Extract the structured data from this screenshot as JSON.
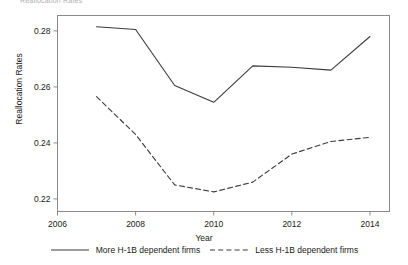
{
  "clipped_header_text": "Reallocation Rates",
  "chart_data": {
    "type": "line",
    "title": "",
    "xlabel": "Year",
    "ylabel": "Reallocation Rates",
    "x": [
      2007,
      2008,
      2009,
      2010,
      2011,
      2012,
      2013,
      2014
    ],
    "xlim": [
      2006,
      2014.5
    ],
    "ylim": [
      0.2155,
      0.2855
    ],
    "xticks": [
      2006,
      2008,
      2010,
      2012,
      2014
    ],
    "xtick_labels": [
      "2006",
      "2008",
      "2010",
      "2012",
      "2014"
    ],
    "yticks": [
      0.22,
      0.24,
      0.26,
      0.28
    ],
    "ytick_labels": [
      "0.22",
      "0.24",
      "0.26",
      "0.28"
    ],
    "grid": false,
    "legend_position": "bottom",
    "series": [
      {
        "name": "More H-1B dependent firms",
        "style": "solid",
        "color": "#3b3b3b",
        "values": [
          0.2815,
          0.2805,
          0.2605,
          0.2545,
          0.2675,
          0.267,
          0.266,
          0.278
        ]
      },
      {
        "name": "Less H-1B dependent firms",
        "style": "dashed",
        "color": "#3b3b3b",
        "values": [
          0.2565,
          0.243,
          0.225,
          0.2225,
          0.226,
          0.236,
          0.2405,
          0.242
        ]
      }
    ]
  }
}
